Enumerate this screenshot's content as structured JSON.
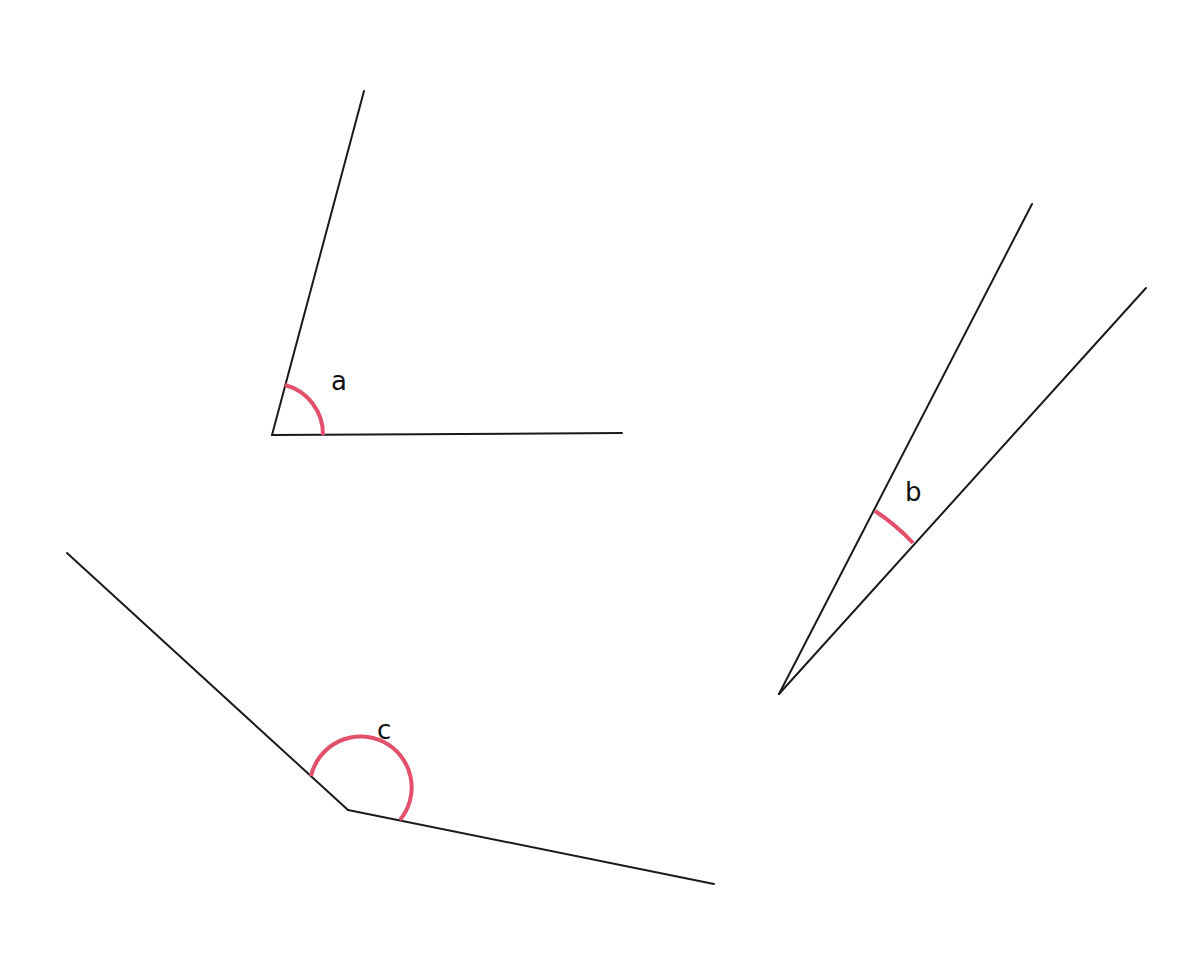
{
  "diagram": {
    "title": "",
    "colors": {
      "line": "#1a1a1a",
      "arc": "#e2506b",
      "background": "#ffffff"
    },
    "angles": [
      {
        "id": "a",
        "label": "a",
        "vertex": [
          272,
          435
        ],
        "ray1_end": [
          364,
          91
        ],
        "ray2_end": [
          622,
          433
        ],
        "arc_start": [
          285,
          385
        ],
        "arc_end": [
          323,
          435
        ],
        "arc_radius": 51,
        "label_pos": [
          331,
          390
        ],
        "type": "acute"
      },
      {
        "id": "b",
        "label": "b",
        "vertex": [
          779,
          694
        ],
        "ray1_end": [
          1032,
          204
        ],
        "ray2_end": [
          1146,
          288
        ],
        "arc_start": [
          875,
          511
        ],
        "arc_end": [
          913,
          543
        ],
        "arc_radius": 205,
        "label_pos": [
          905,
          501
        ],
        "type": "acute"
      },
      {
        "id": "c",
        "label": "c",
        "vertex": [
          348,
          810
        ],
        "ray1_end": [
          67,
          553
        ],
        "ray2_end": [
          714,
          884
        ],
        "arc_start": [
          311,
          776
        ],
        "arc_end": [
          400,
          820
        ],
        "arc_radius": 51,
        "label_pos": [
          377,
          739
        ],
        "type": "obtuse"
      }
    ]
  }
}
